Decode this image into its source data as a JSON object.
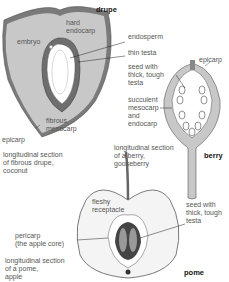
{
  "drupe": {
    "title": "drupe",
    "labels": {
      "hard_endocarp": "hard\nendocarp",
      "embryo": "embryo",
      "endosperm": "endosperm",
      "thin_testa": "thin testa",
      "fibrous_mesocarp": "fibrous\nmesocarp",
      "epicarp": "epicarp"
    },
    "caption": "longitudinal section\nof fibrous drupe,\ncoconut"
  },
  "berry": {
    "title": "berry",
    "labels": {
      "epicarp": "epicarp",
      "seed": "seed with\nthick, tough\ntesta",
      "mesocarp": "succulent\nmesocarp\nand\nendocarp"
    },
    "caption": "longitudinal section\nof a berry,\ngooseberry"
  },
  "pome": {
    "title": "pome",
    "labels": {
      "receptacle": "fleshy\nreceptacle",
      "pericarp": "pericarp\n(the apple core)",
      "seed": "seed with\nthick, tough\ntesta"
    },
    "caption": "longitudinal section\nof a pome,\napple"
  },
  "colors": {
    "flesh": "#c8c8c8",
    "dark": "#7a7a7a",
    "outline": "#555555",
    "apple_flesh": "#f4f4f4"
  }
}
